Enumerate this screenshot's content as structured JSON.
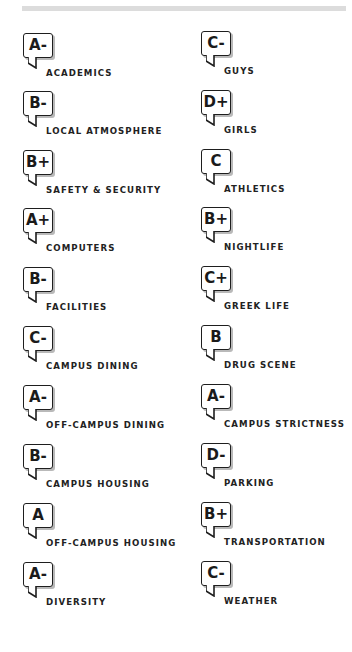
{
  "report_card": {
    "left_column": [
      {
        "grade": "A-",
        "label": "ACADEMICS"
      },
      {
        "grade": "B-",
        "label": "LOCAL ATMOSPHERE"
      },
      {
        "grade": "B+",
        "label": "SAFETY & SECURITY"
      },
      {
        "grade": "A+",
        "label": "COMPUTERS"
      },
      {
        "grade": "B-",
        "label": "FACILITIES"
      },
      {
        "grade": "C-",
        "label": "CAMPUS DINING"
      },
      {
        "grade": "A-",
        "label": "OFF-CAMPUS DINING"
      },
      {
        "grade": "B-",
        "label": "CAMPUS HOUSING"
      },
      {
        "grade": "A",
        "label": "OFF-CAMPUS HOUSING"
      },
      {
        "grade": "A-",
        "label": "DIVERSITY"
      }
    ],
    "right_column": [
      {
        "grade": "C-",
        "label": "GUYS"
      },
      {
        "grade": "D+",
        "label": "GIRLS"
      },
      {
        "grade": "C",
        "label": "ATHLETICS"
      },
      {
        "grade": "B+",
        "label": "NIGHTLIFE"
      },
      {
        "grade": "C+",
        "label": "GREEK LIFE"
      },
      {
        "grade": "B",
        "label": "DRUG SCENE"
      },
      {
        "grade": "A-",
        "label": "CAMPUS STRICTNESS"
      },
      {
        "grade": "D-",
        "label": "PARKING"
      },
      {
        "grade": "B+",
        "label": "TRANSPORTATION"
      },
      {
        "grade": "C-",
        "label": "WEATHER"
      }
    ]
  },
  "icons": {
    "grade_badge": "speech-bubble-icon"
  },
  "colors": {
    "text": "#1a1a1a",
    "bubble_border": "#1e1e1e",
    "bubble_shadow": "#b9b9b9",
    "top_rule": "#dcdcdc"
  }
}
